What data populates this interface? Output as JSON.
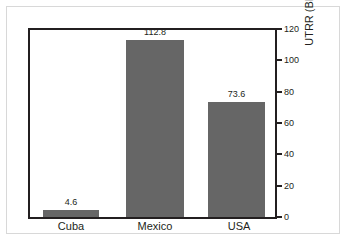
{
  "chart_data": {
    "type": "bar",
    "title": "",
    "subtitle": "",
    "xlabel": "",
    "ylabel": "UTRR (BBOE)",
    "categories": [
      "Cuba",
      "Mexico",
      "USA"
    ],
    "values": [
      4.6,
      112.8,
      73.6
    ],
    "value_labels": [
      "4.6",
      "112.8",
      "73.6"
    ],
    "ylim": [
      0,
      120
    ],
    "ytick_values": [
      0,
      20,
      40,
      60,
      80,
      100,
      120
    ],
    "ytick_labels": [
      "0",
      "20",
      "40",
      "60",
      "80",
      "100",
      "120"
    ],
    "grid": false,
    "legend": false,
    "legend_position": "none",
    "value_axis_side": "right",
    "bar_color": "#666666",
    "axis_color": "#231f20",
    "frame_color": "#d8d8d8",
    "background_color": "#ffffff"
  },
  "axis": {
    "ticks": [
      {
        "label": "0",
        "value": 0
      },
      {
        "label": "20",
        "value": 20
      },
      {
        "label": "40",
        "value": 40
      },
      {
        "label": "60",
        "value": 60
      },
      {
        "label": "80",
        "value": 80
      },
      {
        "label": "100",
        "value": 100
      },
      {
        "label": "120",
        "value": 120
      }
    ],
    "title": "UTRR (BBOE)"
  },
  "bars": [
    {
      "category": "Cuba",
      "value": 4.6,
      "label": "4.6"
    },
    {
      "category": "Mexico",
      "value": 112.8,
      "label": "112.8"
    },
    {
      "category": "USA",
      "value": 73.6,
      "label": "73.6"
    }
  ]
}
